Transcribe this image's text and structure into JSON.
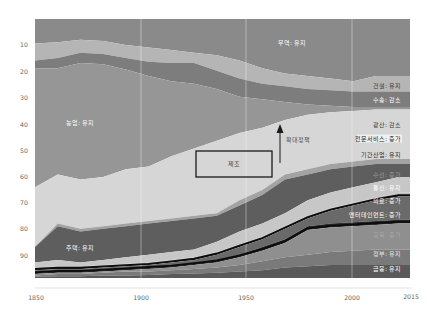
{
  "chart_data": {
    "type": "area",
    "title": "",
    "xlabel": "",
    "ylabel": "",
    "stacked": true,
    "y_inverted": true,
    "xlim": [
      1850,
      2015
    ],
    "ylim": [
      0,
      100
    ],
    "x_ticks": [
      1850,
      1900,
      1950,
      2000,
      2015
    ],
    "y_ticks": [
      10,
      20,
      30,
      40,
      50,
      60,
      70,
      80,
      90
    ],
    "grid": "vertical lines at 1900, 1950, 2000",
    "legend": "inline labels at right edge",
    "x": [
      1850,
      1860,
      1870,
      1880,
      1890,
      1900,
      1910,
      1920,
      1930,
      1940,
      1950,
      1960,
      1970,
      1980,
      1990,
      2000,
      2010,
      2015
    ],
    "boundaries_note": "cumulative % from top (0) to bottom (100); each series occupies the band between the previous boundary and its own boundary",
    "series": [
      {
        "name": "무역",
        "label": "무역: 유지",
        "color": "#8a8a8a",
        "bottom": [
          9.5,
          9,
          8,
          8.5,
          10,
          11,
          12,
          13,
          14,
          16,
          19,
          21,
          22,
          23,
          24,
          22,
          22,
          22
        ]
      },
      {
        "name": "건설",
        "label": "건설: 유지",
        "color": "#b5b5b5",
        "bottom": [
          16,
          15,
          13,
          13.5,
          15,
          16.5,
          17,
          17,
          20,
          23,
          25,
          26,
          27,
          27.5,
          28,
          28,
          28,
          28
        ]
      },
      {
        "name": "수송",
        "label": "수송: 감소",
        "color": "#7d7d7d",
        "bottom": [
          19,
          19,
          17,
          17.5,
          19.5,
          22,
          24,
          25,
          27,
          30,
          31,
          32,
          33,
          33.5,
          34,
          34,
          34,
          34
        ]
      },
      {
        "name": "농업",
        "label": "농업: 유지",
        "color": "#969696",
        "bottom": [
          65,
          60,
          62,
          61,
          58,
          57,
          53,
          50,
          47,
          44,
          42,
          39,
          37,
          36,
          35.5,
          35,
          35,
          35
        ]
      },
      {
        "name": "제조",
        "label": "제조",
        "color": "#d6d6d6",
        "bottom": [
          88,
          79,
          81,
          80,
          79,
          78,
          77,
          76,
          75,
          70,
          66,
          60,
          58,
          56,
          55,
          54,
          54,
          54
        ]
      },
      {
        "name": "광산",
        "label": "광산: 감소",
        "color": "#a3a3a3",
        "bottom": [
          88,
          80,
          82,
          81,
          80,
          79,
          78,
          77,
          76,
          72,
          68,
          62,
          60,
          58,
          57,
          56,
          56,
          56
        ]
      },
      {
        "name": "전문서비스",
        "label": "전문서비스: 증가",
        "color": "#5e5e5e",
        "bottom": [
          94,
          93,
          94,
          93,
          92,
          91,
          90,
          89,
          86,
          82,
          79,
          75,
          70,
          67,
          65,
          63,
          61,
          61
        ]
      },
      {
        "name": "기간산업",
        "label": "기간산업: 유지",
        "color": "#c7c7c7",
        "bottom": [
          96,
          95.5,
          95.5,
          95,
          94.5,
          94,
          93,
          92,
          90,
          87,
          84,
          80,
          76,
          73,
          71,
          69,
          67,
          67
        ]
      },
      {
        "name": "수선",
        "label": "수선: 증가",
        "color": "#bfbfbf",
        "bottom": [
          96.5,
          96,
          96,
          95.5,
          95,
          94.5,
          93.5,
          92.5,
          90.5,
          87.5,
          84.5,
          80.5,
          76.5,
          73.5,
          71.5,
          69.5,
          68,
          68
        ]
      },
      {
        "name": "통신",
        "label": "통신: 유지",
        "color": "#1e1e1e",
        "bottom": [
          97,
          96.5,
          96.5,
          96,
          95.5,
          95,
          94,
          93,
          91,
          88,
          85,
          81,
          77,
          74,
          72,
          70,
          68.5,
          68.5
        ]
      },
      {
        "name": "의료",
        "label": "의료: 증가",
        "color": "#6a6a6a",
        "bottom": [
          98,
          97.5,
          97.5,
          97,
          96.5,
          96,
          95.5,
          94.5,
          93,
          91,
          88,
          85,
          80,
          79,
          78.5,
          78,
          77.5,
          77.5
        ]
      },
      {
        "name": "엔터테인먼트",
        "label": "엔터테인먼트: 증가",
        "color": "#2e2e2e",
        "bottom": [
          98.5,
          98,
          98,
          97.5,
          97,
          96.5,
          96,
          95,
          94,
          92,
          89.5,
          86.5,
          81.5,
          80.5,
          80,
          79.5,
          79,
          79
        ]
      },
      {
        "name": "교육",
        "label": "교육: 증가",
        "color": "#8f8f8f",
        "bottom": [
          99,
          98.5,
          98.5,
          98,
          97.5,
          97.5,
          97,
          96.5,
          96,
          95,
          93.5,
          92,
          91,
          90,
          89.5,
          89,
          89,
          89
        ]
      },
      {
        "name": "정부",
        "label": "정부: 유지",
        "color": "#7a7a7a",
        "bottom": [
          99.5,
          99.3,
          99.3,
          99,
          99,
          98.8,
          98.5,
          98.3,
          98,
          97.5,
          97,
          96,
          95.5,
          95,
          95,
          95,
          95,
          95
        ]
      },
      {
        "name": "금융",
        "label": "금융: 유지",
        "color": "#5a5a5a",
        "bottom": [
          100,
          100,
          100,
          100,
          100,
          100,
          100,
          100,
          100,
          100,
          100,
          100,
          100,
          100,
          100,
          100,
          100,
          100
        ]
      }
    ],
    "annotations": [
      {
        "type": "box",
        "text": "제조",
        "x_range": [
          1925,
          1962
        ],
        "y_range": [
          51,
          59
        ]
      },
      {
        "type": "arrow",
        "text": "확대정책",
        "x": 1966,
        "y_from": 57,
        "y_to": 43
      }
    ]
  },
  "axis": {
    "y_labels": [
      "10",
      "20",
      "30",
      "40",
      "50",
      "60",
      "70",
      "80",
      "90"
    ],
    "x_labels": [
      "1850",
      "1900",
      "1950",
      "2000",
      "2015"
    ]
  },
  "inline_labels": {
    "trade": "무역: 유지",
    "agriculture": "농업: 유지",
    "housing": "주택: 유지",
    "construction": "건설: 유지",
    "transport": "수송: 감소",
    "mining": "광산: 감소",
    "pro_services": "전문서비스: 증가",
    "infrastructure": "기간산업: 유지",
    "repair": "수선: 증가",
    "telecom": "통신: 유지",
    "medical": "의료: 증가",
    "entertainment": "엔터테인먼트: 증가",
    "education": "교육: 증가",
    "government": "정부: 유지",
    "finance": "금융: 유지",
    "manufacturing_box": "제조",
    "expansion_arrow": "확대정책"
  }
}
